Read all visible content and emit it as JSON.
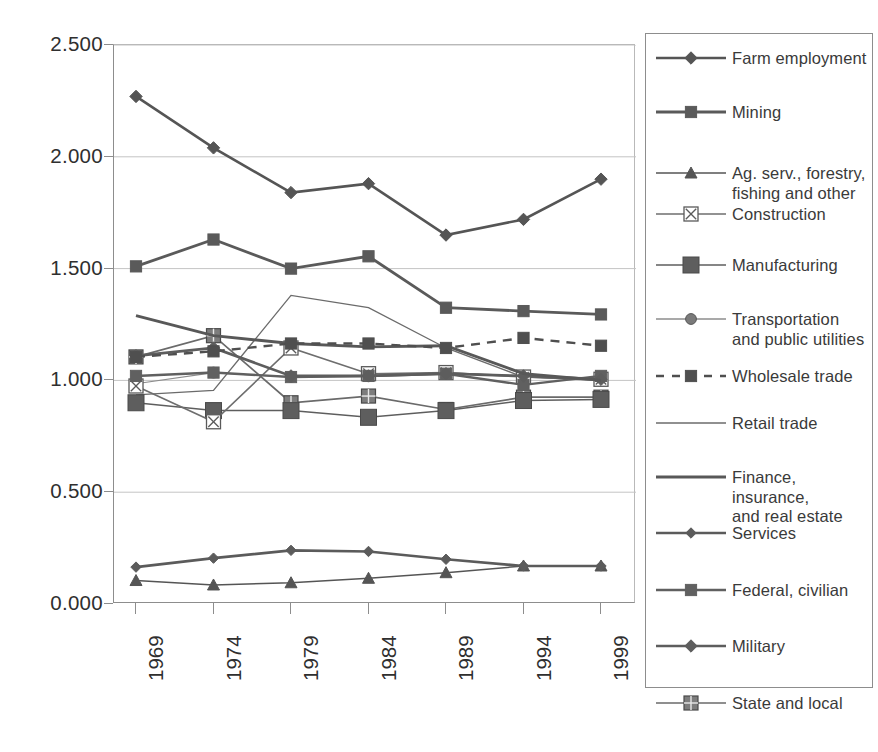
{
  "chart_data": {
    "type": "line",
    "title": "",
    "subtitle": "",
    "xlabel": "",
    "ylabel": "",
    "x": [
      1969,
      1974,
      1979,
      1984,
      1989,
      1994,
      1999
    ],
    "xtick_labels": [
      "1969",
      "1974",
      "1979",
      "1984",
      "1989",
      "1994",
      "1999"
    ],
    "ytick_labels": [
      "0.000",
      "0.500",
      "1.000",
      "1.500",
      "2.000",
      "2.500"
    ],
    "ytick_values": [
      0.0,
      0.5,
      1.0,
      1.5,
      2.0,
      2.5
    ],
    "ylim": [
      0.0,
      2.5
    ],
    "grid": "horizontal",
    "legend_position": "right",
    "series": [
      {
        "name": "Farm employment",
        "marker": "diamond",
        "line": "solid",
        "linewidth": 2.6,
        "color": "#555555",
        "values": [
          2.27,
          2.04,
          1.84,
          1.88,
          1.65,
          1.72,
          1.9
        ]
      },
      {
        "name": "Mining",
        "marker": "square",
        "line": "solid",
        "linewidth": 2.8,
        "color": "#5a5a5a",
        "values": [
          1.51,
          1.63,
          1.5,
          1.555,
          1.325,
          1.31,
          1.295
        ]
      },
      {
        "name": "Ag. serv., forestry, fishing and other",
        "marker": "triangle",
        "line": "solid",
        "linewidth": 1.5,
        "color": "#555555",
        "values": [
          0.105,
          0.085,
          0.095,
          0.115,
          0.14,
          0.17,
          0.17
        ]
      },
      {
        "name": "Construction",
        "marker": "square-x",
        "line": "solid",
        "linewidth": 1.6,
        "color": "#6e6e6e",
        "values": [
          0.975,
          0.815,
          1.145,
          1.03,
          1.035,
          1.015,
          1.005
        ]
      },
      {
        "name": "Manufacturing",
        "marker": "square-large",
        "line": "solid",
        "linewidth": 1.5,
        "color": "#5e5e5e",
        "values": [
          0.9,
          0.865,
          0.865,
          0.835,
          0.865,
          0.91,
          0.915
        ]
      },
      {
        "name": "Transportation and public utilities",
        "marker": "circle",
        "line": "solid",
        "linewidth": 1.2,
        "color": "#8c8c8c",
        "values": [
          0.985,
          1.035,
          1.015,
          1.02,
          1.035,
          1.02,
          1.01
        ]
      },
      {
        "name": "Wholesale trade",
        "marker": "square",
        "line": "dashed",
        "linewidth": 2.4,
        "color": "#4f4f4f",
        "values": [
          1.105,
          1.13,
          1.165,
          1.165,
          1.145,
          1.19,
          1.155
        ]
      },
      {
        "name": "Retail trade",
        "marker": "none",
        "line": "solid",
        "linewidth": 1.3,
        "color": "#6b6b6b",
        "values": [
          0.935,
          0.955,
          1.38,
          1.325,
          1.145,
          1.015,
          1.0
        ]
      },
      {
        "name": "Finance, insurance, and real estate",
        "marker": "none",
        "line": "solid",
        "linewidth": 2.9,
        "color": "#585858",
        "values": [
          1.29,
          1.2,
          1.165,
          1.15,
          1.155,
          1.03,
          1.0
        ]
      },
      {
        "name": "Services",
        "marker": "diamond-small",
        "line": "solid",
        "linewidth": 2.6,
        "color": "#5b5b5b",
        "values": [
          0.165,
          0.205,
          0.24,
          0.235,
          0.2,
          0.17,
          0.17
        ]
      },
      {
        "name": "Federal, civilian",
        "marker": "square",
        "line": "solid",
        "linewidth": 2.4,
        "color": "#606060",
        "values": [
          1.02,
          1.035,
          1.015,
          1.02,
          1.03,
          0.98,
          1.02
        ]
      },
      {
        "name": "Military",
        "marker": "diamond",
        "line": "solid",
        "linewidth": 2.7,
        "color": "#5d5d5d",
        "values": [
          1.11,
          1.145,
          1.02,
          1.02,
          1.03,
          1.02,
          1.005
        ]
      },
      {
        "name": "State and local",
        "marker": "square-grid",
        "line": "solid",
        "linewidth": 1.7,
        "color": "#6a6a6a",
        "values": [
          1.105,
          1.2,
          0.9,
          0.93,
          0.87,
          0.925,
          0.925
        ]
      }
    ]
  },
  "legend": {
    "items": [
      {
        "label": "Farm employment"
      },
      {
        "label": "Mining"
      },
      {
        "label": "Ag. serv., forestry,\nfishing and other"
      },
      {
        "label": "Construction"
      },
      {
        "label": "Manufacturing"
      },
      {
        "label": "Transportation\nand public utilities"
      },
      {
        "label": "Wholesale trade"
      },
      {
        "label": "Retail trade"
      },
      {
        "label": "Finance, insurance,\nand real estate"
      },
      {
        "label": "Services"
      },
      {
        "label": "Federal, civilian"
      },
      {
        "label": "Military"
      },
      {
        "label": "State and local"
      }
    ]
  }
}
